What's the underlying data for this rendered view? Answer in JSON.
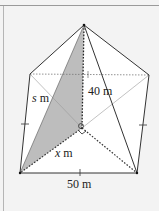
{
  "diagram": {
    "type": "square-pyramid",
    "labels": {
      "height": "40 m",
      "slant_edge_var": "s",
      "slant_edge_unit": " m",
      "half_diagonal_var": "x",
      "half_diagonal_unit": " m",
      "base_side": "50 m"
    },
    "colors": {
      "background": "#f3f3f3",
      "face_fill": "#ffffff",
      "shaded_triangle": "#bdbdbd",
      "edge_stroke": "#333333",
      "hidden_stroke": "#555555"
    }
  }
}
